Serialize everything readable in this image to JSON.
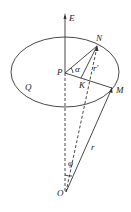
{
  "labels": {
    "E": "E",
    "N": "N",
    "P": "P",
    "alpha": "α",
    "r_prime": "r'",
    "Q": "Q",
    "K": "K",
    "M": "M",
    "r": "r",
    "phi": "φ",
    "O": "O"
  }
}
